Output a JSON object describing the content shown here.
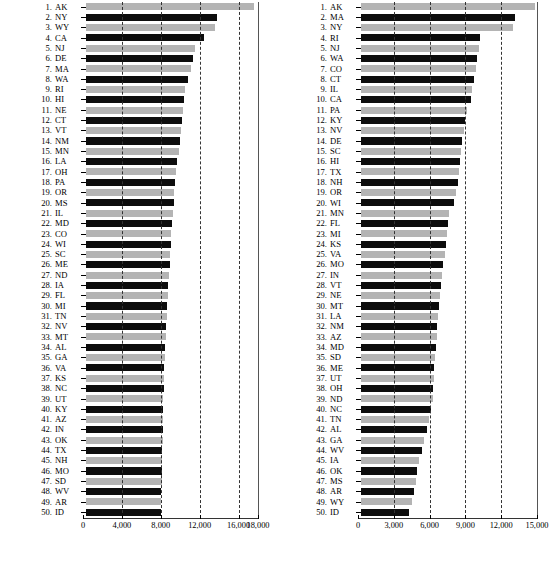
{
  "chart_data": [
    {
      "id": "left",
      "type": "bar",
      "orientation": "horizontal",
      "title": "",
      "xlabel": "",
      "ylabel": "",
      "xlim": [
        0,
        18000
      ],
      "ticks": [
        0,
        4000,
        8000,
        12000,
        16000,
        18000
      ],
      "tick_labels": [
        "0",
        "4,000",
        "8,000",
        "12,000",
        "16,000",
        "18,000"
      ],
      "gridlines": [
        4000,
        8000,
        12000,
        16000
      ],
      "grid": true,
      "legend": "none",
      "bar_colors": [
        "#b4b4b4",
        "#0d0d0d"
      ],
      "categories": [
        "AK",
        "NY",
        "WY",
        "CA",
        "NJ",
        "DE",
        "MA",
        "WA",
        "RI",
        "HI",
        "NE",
        "CT",
        "VT",
        "NM",
        "MN",
        "LA",
        "OH",
        "PA",
        "OR",
        "MS",
        "IL",
        "MD",
        "CO",
        "WI",
        "SC",
        "ME",
        "ND",
        "IA",
        "FL",
        "MI",
        "TN",
        "NV",
        "MT",
        "AL",
        "GA",
        "VA",
        "KS",
        "NC",
        "UT",
        "KY",
        "AZ",
        "IN",
        "OK",
        "TX",
        "NH",
        "MO",
        "SD",
        "WV",
        "AR",
        "ID"
      ],
      "ranks": [
        1,
        2,
        3,
        4,
        5,
        6,
        7,
        8,
        9,
        10,
        11,
        12,
        13,
        14,
        15,
        16,
        17,
        18,
        19,
        20,
        21,
        22,
        23,
        24,
        25,
        26,
        27,
        28,
        29,
        30,
        31,
        32,
        33,
        34,
        35,
        36,
        37,
        38,
        39,
        40,
        41,
        42,
        43,
        44,
        45,
        46,
        47,
        48,
        49,
        50
      ],
      "values": [
        17300,
        13500,
        13300,
        12100,
        11200,
        11000,
        10800,
        10500,
        10200,
        10100,
        10000,
        9900,
        9800,
        9700,
        9600,
        9400,
        9300,
        9200,
        9100,
        9000,
        8900,
        8800,
        8750,
        8700,
        8650,
        8600,
        8500,
        8450,
        8400,
        8350,
        8300,
        8250,
        8200,
        8150,
        8100,
        8050,
        8000,
        7980,
        7960,
        7940,
        7920,
        7900,
        7880,
        7860,
        7840,
        7800,
        7780,
        7760,
        7740,
        7700
      ]
    },
    {
      "id": "right",
      "type": "bar",
      "orientation": "horizontal",
      "title": "",
      "xlabel": "",
      "ylabel": "",
      "xlim": [
        0,
        15000
      ],
      "ticks": [
        0,
        3000,
        6000,
        9000,
        12000,
        15000
      ],
      "tick_labels": [
        "0",
        "3,000",
        "6,000",
        "9,000",
        "12,000",
        "15,000"
      ],
      "gridlines": [
        3000,
        6000,
        9000,
        12000
      ],
      "grid": true,
      "legend": "none",
      "bar_colors": [
        "#b4b4b4",
        "#0d0d0d"
      ],
      "categories": [
        "AK",
        "MA",
        "NY",
        "RI",
        "NJ",
        "WA",
        "CO",
        "CT",
        "IL",
        "CA",
        "PA",
        "KY",
        "NV",
        "DE",
        "SC",
        "HI",
        "TX",
        "NH",
        "OR",
        "WI",
        "MN",
        "FL",
        "MI",
        "KS",
        "VA",
        "MO",
        "IN",
        "VT",
        "NE",
        "MT",
        "LA",
        "NM",
        "AZ",
        "MD",
        "SD",
        "ME",
        "UT",
        "OH",
        "ND",
        "NC",
        "TN",
        "AL",
        "GA",
        "WV",
        "IA",
        "OK",
        "MS",
        "AR",
        "WY",
        "ID"
      ],
      "ranks": [
        1,
        2,
        3,
        4,
        5,
        6,
        7,
        8,
        9,
        10,
        11,
        12,
        13,
        14,
        15,
        16,
        17,
        18,
        19,
        20,
        21,
        22,
        23,
        24,
        25,
        26,
        27,
        28,
        29,
        30,
        31,
        32,
        33,
        34,
        35,
        36,
        37,
        38,
        39,
        40,
        41,
        42,
        43,
        44,
        45,
        46,
        47,
        48,
        49,
        50
      ],
      "values": [
        14600,
        12900,
        12700,
        10000,
        9900,
        9700,
        9600,
        9500,
        9300,
        9200,
        8900,
        8700,
        8600,
        8500,
        8400,
        8300,
        8200,
        8100,
        8000,
        7800,
        7400,
        7300,
        7200,
        7100,
        7000,
        6900,
        6800,
        6700,
        6600,
        6500,
        6450,
        6400,
        6350,
        6300,
        6200,
        6150,
        6100,
        6050,
        6000,
        5900,
        5700,
        5500,
        5300,
        5100,
        4900,
        4700,
        4600,
        4400,
        4300,
        4000
      ]
    }
  ]
}
